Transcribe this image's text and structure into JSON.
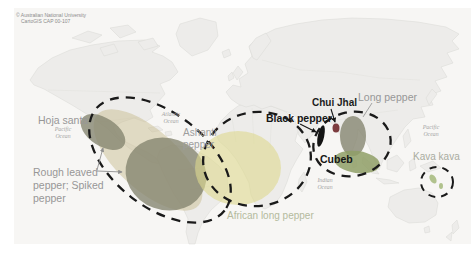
{
  "attribution": {
    "line1": "© Australian National University",
    "line2": "CartoGIS CAP 00-107"
  },
  "oceans": {
    "pacific_west": {
      "line1": "Pacific",
      "line2": "Ocean"
    },
    "atlantic": {
      "line1": "Atlantic",
      "line2": "Ocean"
    },
    "indian": {
      "line1": "Indian",
      "line2": "Ocean"
    },
    "pacific_east": {
      "line1": "Pacific",
      "line2": "Ocean"
    }
  },
  "peppers": {
    "hoja_santa": {
      "label": "Hoja santa"
    },
    "rough_leaved": {
      "line1": "Rough leaved",
      "line2": "pepper; Spiked",
      "line3": "pepper"
    },
    "ashanti": {
      "line1": "Ashanti",
      "line2": "pepper"
    },
    "african_long": {
      "label": "African long pepper"
    },
    "black_pepper": {
      "label": "Black pepper"
    },
    "chui_jhal": {
      "label": "Chui Jhal"
    },
    "long_pepper": {
      "label": "Long pepper"
    },
    "cubeb": {
      "label": "Cubeb"
    },
    "kava_kava": {
      "label": "Kava kava"
    }
  },
  "colors": {
    "map_bg": "#f7f6f4",
    "land": "#edecea",
    "ring": "#1a1a1a",
    "dark_olive": "#84846e",
    "khaki_band": "#c9bd92",
    "africa_yellow": "#ddd88e",
    "cubeb_green": "#8f9f66",
    "chui_maroon": "#763336",
    "black_pepper": "#141414",
    "kava_green": "#a8bc82",
    "arrow_gray": "#8f8f8f"
  }
}
